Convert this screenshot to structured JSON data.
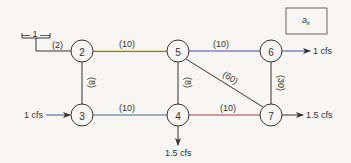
{
  "legend": {
    "label": "a",
    "subscript": "k"
  },
  "reservoir": {
    "label": "1"
  },
  "nodes": [
    {
      "id": "2",
      "x": 82,
      "y": 51
    },
    {
      "id": "5",
      "x": 178,
      "y": 51
    },
    {
      "id": "6",
      "x": 271,
      "y": 51
    },
    {
      "id": "3",
      "x": 82,
      "y": 115
    },
    {
      "id": "4",
      "x": 178,
      "y": 115
    },
    {
      "id": "7",
      "x": 271,
      "y": 115
    }
  ],
  "pipes": [
    {
      "from": "1",
      "to": "2",
      "label": "(2)"
    },
    {
      "from": "2",
      "to": "5",
      "label": "(10)"
    },
    {
      "from": "5",
      "to": "6",
      "label": "(10)"
    },
    {
      "from": "2",
      "to": "3",
      "label": "(8)"
    },
    {
      "from": "5",
      "to": "4",
      "label": "(8)"
    },
    {
      "from": "5",
      "to": "7",
      "label": "(60)"
    },
    {
      "from": "6",
      "to": "7",
      "label": "(30)"
    },
    {
      "from": "3",
      "to": "4",
      "label": "(10)"
    },
    {
      "from": "4",
      "to": "7",
      "label": "(10)"
    }
  ],
  "flows": {
    "inflow_3": "1 cfs",
    "outflow_6": "1 cfs",
    "outflow_7": "1.5 cfs",
    "outflow_4": "1.5 cfs"
  },
  "colors": {
    "line": "#333333",
    "pipe_2_5": "#c8b64a",
    "pipe_5_6": "#4a4aa8",
    "pipe_3_4": "#3a6a8a",
    "pipe_4_7": "#a83a4a",
    "background": "#f7f6f2"
  }
}
